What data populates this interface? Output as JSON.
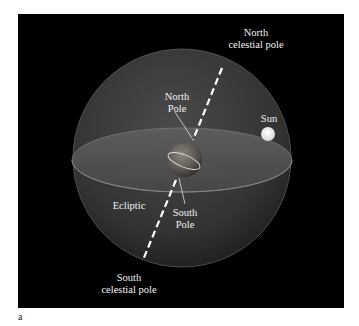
{
  "figure": {
    "panel_letter": "a",
    "colors": {
      "background": "#000000",
      "sphere": "#3a3a3a",
      "ecliptic_plane": "#555555",
      "earth": "#6e6a64",
      "axis": "#ffffff",
      "sun": "#f4f4f4",
      "text": "#f2f2f2"
    }
  },
  "labels": {
    "north_celestial_pole": {
      "line1": "North",
      "line2": "celestial pole"
    },
    "north_pole": {
      "line1": "North",
      "line2": "Pole"
    },
    "sun": "Sun",
    "ecliptic": "Ecliptic",
    "south_pole": {
      "line1": "South",
      "line2": "Pole"
    },
    "south_celestial_pole": {
      "line1": "South",
      "line2": "celestial pole"
    }
  }
}
